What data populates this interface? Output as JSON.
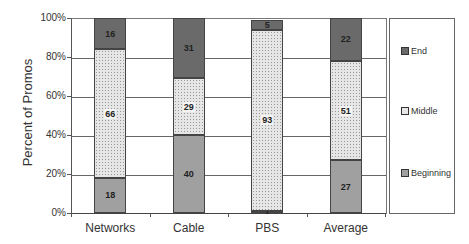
{
  "chart_data": {
    "type": "bar",
    "stacked": true,
    "title": "",
    "xlabel": "",
    "ylabel": "Percent of Promos",
    "ylim": [
      0,
      100
    ],
    "yticks": [
      "0%",
      "20%",
      "40%",
      "60%",
      "80%",
      "100%"
    ],
    "grid": true,
    "legend_position": "right",
    "categories": [
      "Networks",
      "Cable",
      "PBS",
      "Average"
    ],
    "series": [
      {
        "name": "Beginning",
        "values": [
          18,
          40,
          1,
          27
        ],
        "color": "#a0a0a0"
      },
      {
        "name": "Middle",
        "values": [
          66,
          29,
          93,
          51
        ],
        "color": "#e6e6e6"
      },
      {
        "name": "End",
        "values": [
          16,
          31,
          5,
          22
        ],
        "color": "#6a6a6a"
      }
    ],
    "legend_order": [
      "End",
      "Middle",
      "Beginning"
    ]
  }
}
